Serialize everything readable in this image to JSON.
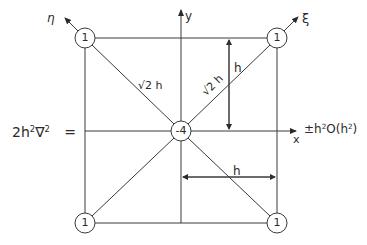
{
  "diagram": {
    "title": "",
    "operator_lhs": {
      "coeff": "2h",
      "exp1": "2",
      "nabla": "∇",
      "exp2": "2",
      "equals": "="
    },
    "nodes": [
      {
        "id": "top-left",
        "value": "1"
      },
      {
        "id": "top-right",
        "value": "1"
      },
      {
        "id": "center",
        "value": "-4"
      },
      {
        "id": "bottom-left",
        "value": "1"
      },
      {
        "id": "bottom-right",
        "value": "1"
      }
    ],
    "axes": {
      "x": "x",
      "y": "y",
      "xi": "ξ",
      "eta": "η"
    },
    "dimensions": {
      "diag_left": "√2 h",
      "diag_right": "√2 h",
      "vertical_h": "h",
      "horizontal_h": "h"
    },
    "error_term": {
      "pm": "±",
      "h": "h",
      "exp1": "2",
      "O": "O(h",
      "exp2": "2",
      "close": ")"
    },
    "colors": {
      "line": "#3a3a3a",
      "background": "#ffffff"
    }
  }
}
